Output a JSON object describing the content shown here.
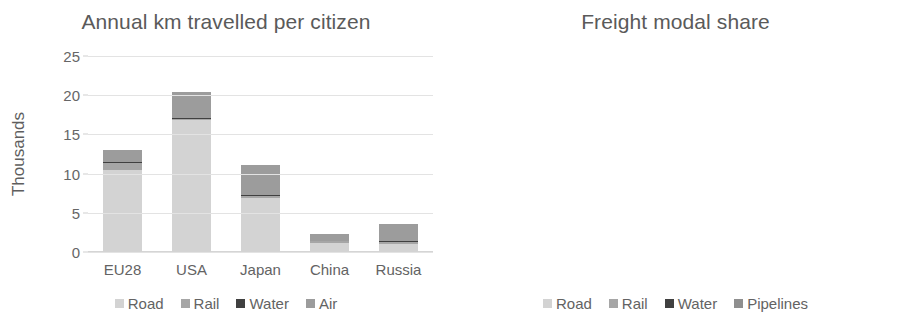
{
  "figure": {
    "background": "#ffffff",
    "text_color": "#5a5a5a"
  },
  "palette": {
    "road": "#d3d3d3",
    "rail": "#a6a6a6",
    "water": "#404040",
    "air": "#9c9c9c",
    "pipelines": "#8f8f8f",
    "gridline": "#e3e3e3"
  },
  "chart_data": [
    {
      "type": "bar",
      "subtype": "stacked",
      "title": "Annual km travelled per citizen",
      "xlabel": "",
      "ylabel": "Thousands",
      "categories": [
        "EU28",
        "USA",
        "Japan",
        "China",
        "Russia"
      ],
      "yticks": [
        "0",
        "5",
        "10",
        "15",
        "20",
        "25"
      ],
      "ytick_values": [
        0,
        5,
        10,
        15,
        20,
        25
      ],
      "ylim": [
        0,
        25
      ],
      "grid": true,
      "legend_position": "bottom",
      "series": [
        {
          "name": "Road",
          "color": "#d3d3d3",
          "values": [
            10.4,
            16.9,
            6.9,
            1.1,
            1.0
          ]
        },
        {
          "name": "Rail",
          "color": "#a6a6a6",
          "values": [
            1.0,
            0.1,
            0.3,
            0.3,
            0.3
          ]
        },
        {
          "name": "Water",
          "color": "#404040",
          "values": [
            0.1,
            0.05,
            0.05,
            0.05,
            0.05
          ]
        },
        {
          "name": "Air",
          "color": "#9c9c9c",
          "values": [
            1.5,
            3.4,
            3.8,
            0.8,
            2.2
          ]
        }
      ],
      "totals": [
        13.0,
        20.45,
        11.05,
        2.25,
        3.55
      ]
    },
    {
      "type": "bar",
      "subtype": "stacked-100",
      "title": "Freight modal share",
      "xlabel": "",
      "ylabel": "",
      "categories": [
        "EU28",
        "USA",
        "Japan",
        "China",
        "Russia"
      ],
      "yticks": [
        "0%",
        "20%",
        "40%",
        "60%",
        "80%",
        "100%"
      ],
      "ytick_values": [
        0,
        20,
        40,
        60,
        80,
        100
      ],
      "ylim": [
        0,
        100
      ],
      "grid": true,
      "legend_position": "bottom",
      "series": [
        {
          "name": "Road",
          "color": "#d3d3d3",
          "values": [
            48,
            38,
            51,
            33,
            5
          ]
        },
        {
          "name": "Rail",
          "color": "#a6a6a6",
          "values": [
            12,
            34,
            4,
            12,
            60
          ]
        },
        {
          "name": "Water",
          "color": "#404040",
          "values": [
            38,
            9,
            45,
            53,
            1.5
          ]
        },
        {
          "name": "Pipelines",
          "color": "#8f8f8f",
          "values": [
            2,
            19,
            0,
            2,
            33.5
          ]
        }
      ],
      "totals": [
        100,
        100,
        100,
        100,
        100
      ]
    }
  ]
}
